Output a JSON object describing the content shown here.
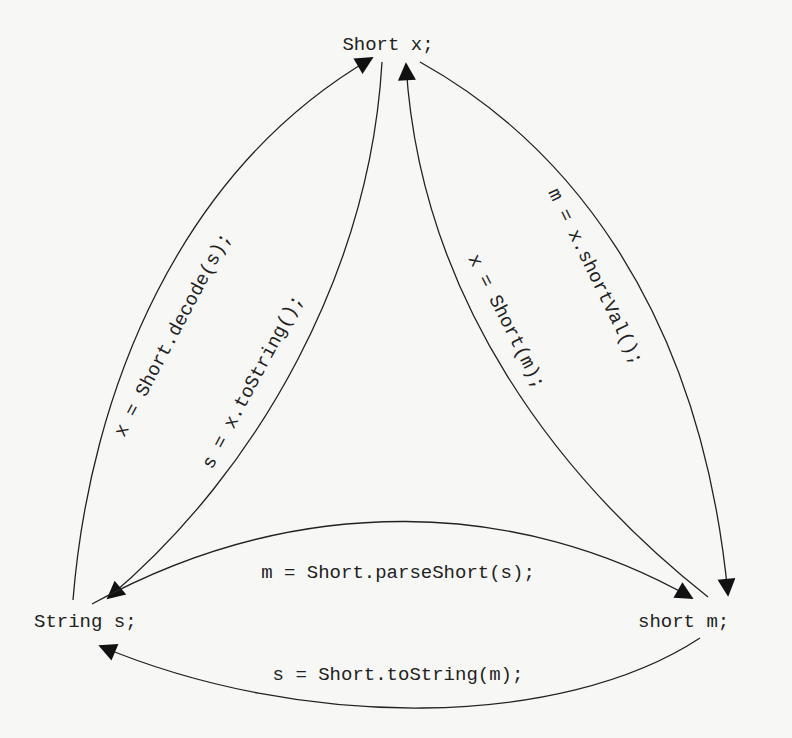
{
  "nodes": {
    "short_obj": "Short x;",
    "string": "String s;",
    "short_prim": "short m;"
  },
  "edges": {
    "decode": "x = Short.decode(s);",
    "tostring_obj": "s = x.toString();",
    "constructor": "x = Short(m);",
    "shortval": "m = x.shortVal();",
    "parse": "m = Short.parseShort(s);",
    "tostring_static": "s = Short.toString(m);"
  },
  "colors": {
    "ink": "#222222",
    "background": "#f7f7f5"
  }
}
